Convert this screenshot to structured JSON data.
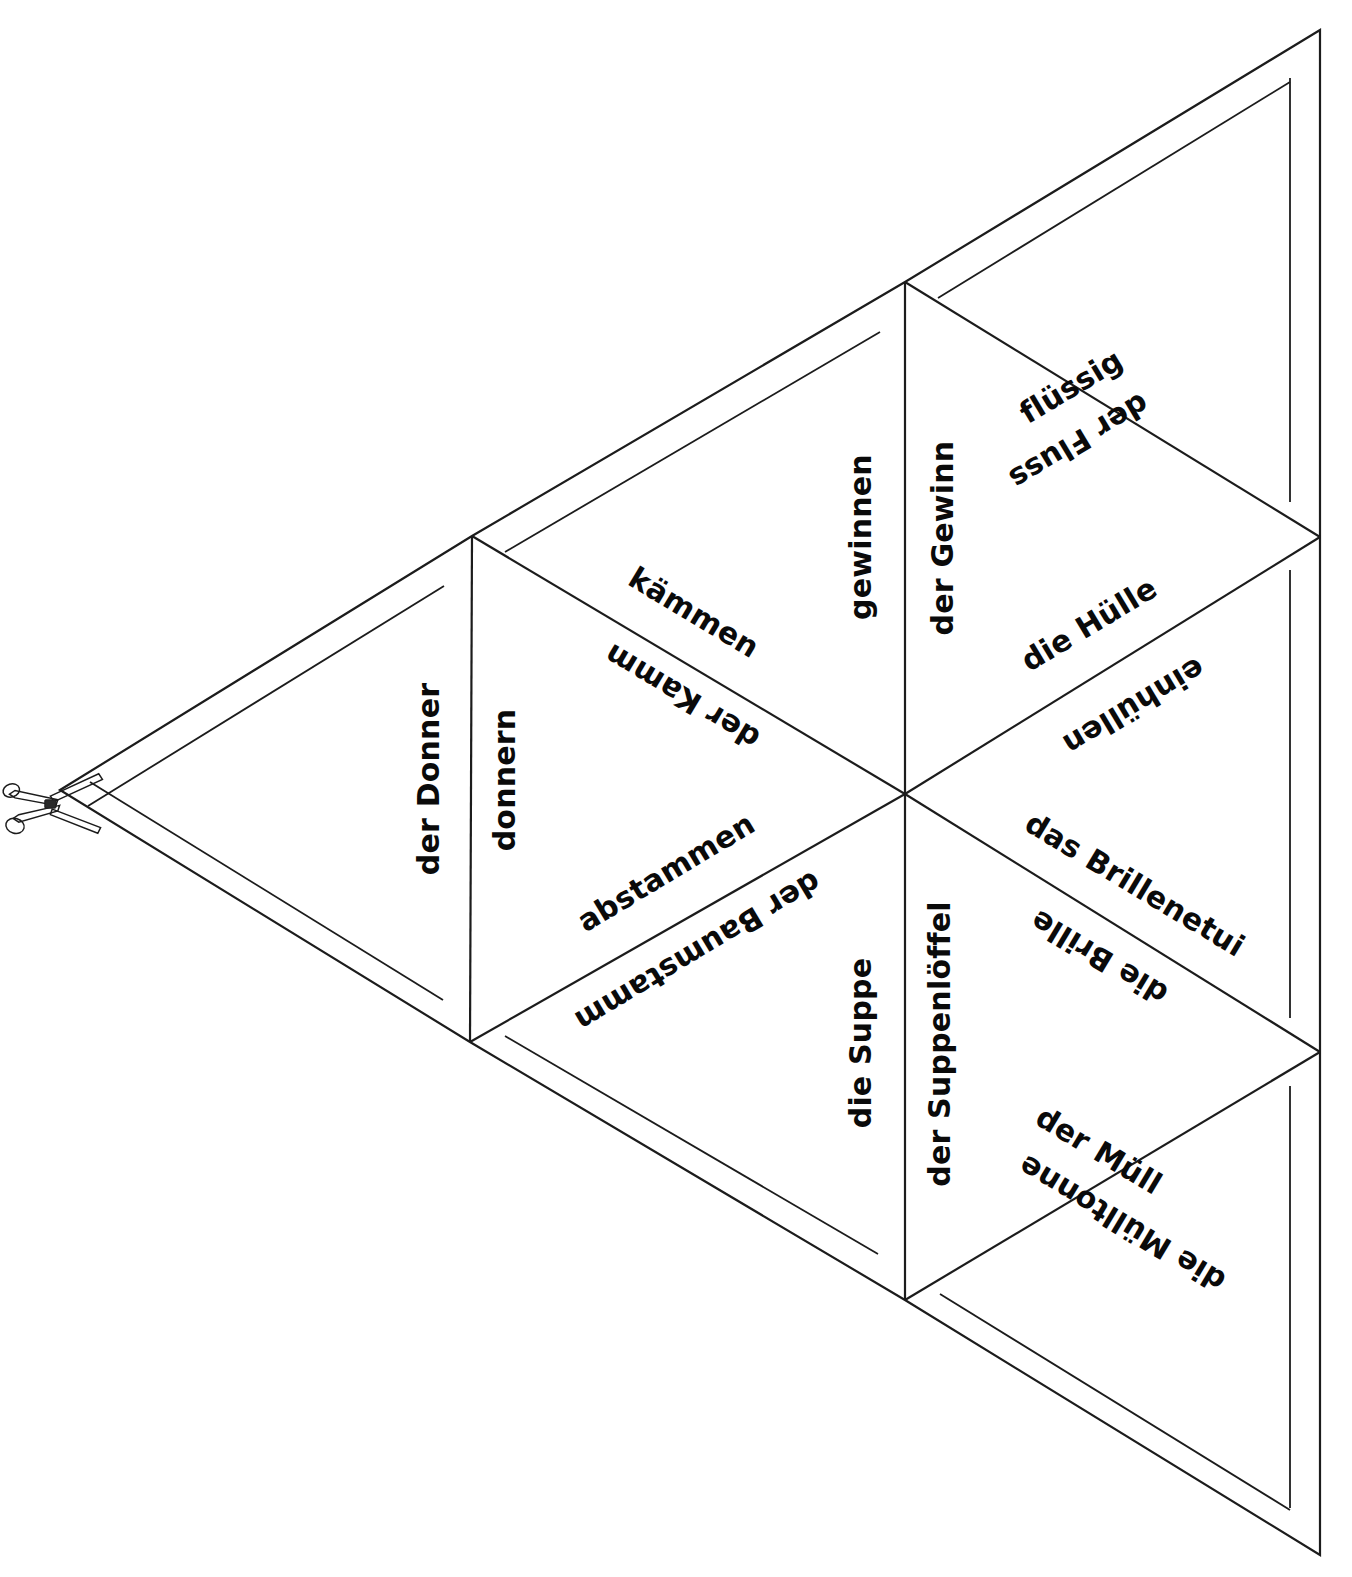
{
  "document": {
    "type": "tarsia-trimino-puzzle-worksheet",
    "language": "German",
    "background_color": "#ffffff",
    "line_color": "#1c1c1c",
    "text_color": "#0a0a0a"
  },
  "icons": {
    "scissors": "scissors-icon"
  },
  "labels": {
    "fluessig": "flüssig",
    "der_fluss": "der Fluss",
    "gewinnen": "gewinnen",
    "der_gewinn": "der Gewinn",
    "die_huelle": "die Hülle",
    "einhuellen": "einhüllen",
    "kaemmen": "kämmen",
    "der_kamm": "der Kamm",
    "der_donner": "der Donner",
    "donnern": "donnern",
    "abstammen": "abstammen",
    "der_baumstamm": "der Baumstamm",
    "das_brillenetui": "das Brillenetui",
    "die_brille": "die Brille",
    "die_suppe": "die Suppe",
    "der_suppenloeffel": "der Suppenlöffel",
    "der_muell": "der Müll",
    "die_muelltonne": "die Mülltonne"
  },
  "pairs": [
    {
      "id": "pair-fluss",
      "a": "flüssig",
      "b": "der Fluss",
      "edge": "top-right-outer"
    },
    {
      "id": "pair-gewinn",
      "a": "gewinnen",
      "b": "der Gewinn",
      "edge": "upper-vertical"
    },
    {
      "id": "pair-huelle",
      "a": "die Hülle",
      "b": "einhüllen",
      "edge": "right-upper-diagonal"
    },
    {
      "id": "pair-kamm",
      "a": "kämmen",
      "b": "der Kamm",
      "edge": "upper-left-diagonal"
    },
    {
      "id": "pair-donner",
      "a": "der Donner",
      "b": "donnern",
      "edge": "left-vertical"
    },
    {
      "id": "pair-stamm",
      "a": "abstammen",
      "b": "der Baumstamm",
      "edge": "lower-left-diagonal"
    },
    {
      "id": "pair-brille",
      "a": "das Brillenetui",
      "b": "die Brille",
      "edge": "right-lower-diagonal"
    },
    {
      "id": "pair-suppe",
      "a": "die Suppe",
      "b": "der Suppenlöffel",
      "edge": "lower-vertical"
    },
    {
      "id": "pair-muell",
      "a": "der Müll",
      "b": "die Mülltonne",
      "edge": "bottom-right-outer"
    }
  ],
  "geometry": {
    "left_vertex": [
      60,
      790
    ],
    "top_left_vertex": [
      472,
      536
    ],
    "bottom_left_vertex": [
      470,
      1042
    ],
    "center_vertex": [
      905,
      794
    ],
    "top_mid_vertex": [
      905,
      282
    ],
    "bottom_mid_vertex": [
      905,
      1300
    ],
    "right_top_vertex": [
      1320,
      537
    ],
    "right_bottom_vertex": [
      1320,
      1052
    ],
    "top_right_corner": [
      1320,
      30
    ],
    "bottom_right_corner": [
      1320,
      1555
    ]
  }
}
